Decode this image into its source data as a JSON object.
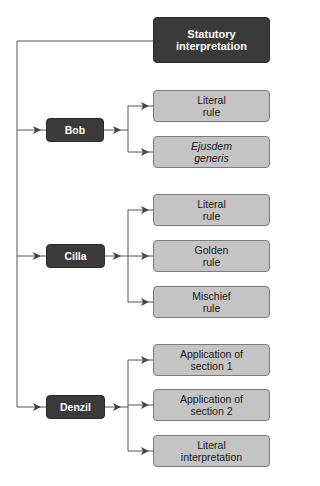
{
  "root": {
    "label": "Statutory\ninterpretation"
  },
  "people": [
    {
      "name": "Bob",
      "rules": [
        {
          "label": "Literal\nrule",
          "italic": false
        },
        {
          "label": "Ejusdem\ngeneris",
          "italic": true
        }
      ]
    },
    {
      "name": "Cilla",
      "rules": [
        {
          "label": "Literal\nrule",
          "italic": false
        },
        {
          "label": "Golden\nrule",
          "italic": false
        },
        {
          "label": "Mischief\nrule",
          "italic": false
        }
      ]
    },
    {
      "name": "Denzil",
      "rules": [
        {
          "label": "Application of\nsection 1",
          "italic": false
        },
        {
          "label": "Application of\nsection 2",
          "italic": false
        },
        {
          "label": "Literal\ninterpretation",
          "italic": false
        }
      ]
    }
  ],
  "colors": {
    "dark_box": "#3a3a3a",
    "light_box": "#c4c4c4",
    "line": "#555555"
  }
}
